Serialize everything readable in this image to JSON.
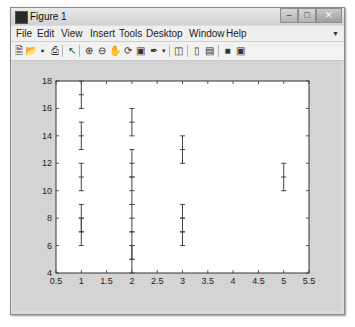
{
  "window": {
    "title": "Figure 1",
    "controls": [
      "minimize",
      "maximize",
      "close"
    ]
  },
  "menubar": {
    "items": [
      "File",
      "Edit",
      "View",
      "Insert",
      "Tools",
      "Desktop",
      "Window",
      "Help"
    ]
  },
  "toolbar": {
    "icons": [
      "new-figure-icon",
      "open-file-icon",
      "save-icon",
      "print-icon",
      "edit-plot-arrow-icon",
      "zoom-in-icon",
      "zoom-out-icon",
      "pan-hand-icon",
      "rotate-3d-icon",
      "data-cursor-icon",
      "brush-icon",
      "link-plot-icon",
      "colorbar-icon",
      "legend-icon",
      "hide-plot-tools-icon",
      "show-plot-tools-icon"
    ]
  },
  "chart_data": {
    "type": "errorbar",
    "title": "",
    "xlabel": "",
    "ylabel": "",
    "xlim": [
      0.5,
      5.5
    ],
    "ylim": [
      4,
      18
    ],
    "xticks": [
      "0.5",
      "1",
      "1.5",
      "2",
      "2.5",
      "3",
      "3.5",
      "4",
      "4.5",
      "5",
      "5.5"
    ],
    "yticks": [
      "4",
      "6",
      "8",
      "10",
      "12",
      "14",
      "16",
      "18"
    ],
    "grid": false,
    "legend": null,
    "series": [
      {
        "name": "errorbars",
        "points": [
          {
            "x": 1,
            "y": 17,
            "err": 1
          },
          {
            "x": 1,
            "y": 14,
            "err": 1
          },
          {
            "x": 1,
            "y": 11,
            "err": 1
          },
          {
            "x": 1,
            "y": 8,
            "err": 1
          },
          {
            "x": 1,
            "y": 7,
            "err": 1
          },
          {
            "x": 2,
            "y": 15,
            "err": 1
          },
          {
            "x": 2,
            "y": 12,
            "err": 1
          },
          {
            "x": 2,
            "y": 10,
            "err": 1
          },
          {
            "x": 2,
            "y": 8,
            "err": 1
          },
          {
            "x": 2,
            "y": 6,
            "err": 1
          },
          {
            "x": 2,
            "y": 5,
            "err": 1
          },
          {
            "x": 3,
            "y": 13,
            "err": 1
          },
          {
            "x": 3,
            "y": 8,
            "err": 1
          },
          {
            "x": 3,
            "y": 7,
            "err": 1
          },
          {
            "x": 5,
            "y": 11,
            "err": 1
          }
        ]
      }
    ]
  }
}
